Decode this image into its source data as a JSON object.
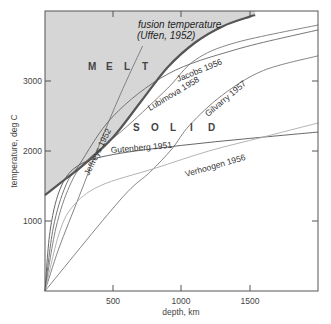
{
  "chart_data": {
    "type": "line",
    "title": "",
    "xlabel": "depth, km",
    "ylabel": "temperature, deg C",
    "xlim": [
      0,
      2000
    ],
    "ylim": [
      0,
      4000
    ],
    "x_ticks": [
      500,
      1000,
      1500
    ],
    "y_ticks": [
      1000,
      2000,
      3000
    ],
    "x_tick_labels": [
      "500",
      "1000",
      "1500"
    ],
    "y_tick_labels": [
      "1000",
      "2000",
      "3000"
    ],
    "grid": false,
    "legend": "inline curve labels",
    "regions": [
      {
        "label": "M E L T",
        "fill": "#d6d6d6",
        "description": "area above fusion temperature curve"
      },
      {
        "label": "S O L I D",
        "fill": "#ffffff",
        "description": "area below fusion temperature curve"
      }
    ],
    "series": [
      {
        "name": "fusion temperature (Uffen, 1952)",
        "style": "thick",
        "color": "#555555",
        "x": [
          0,
          150,
          300,
          500,
          700,
          900,
          1100,
          1300,
          1500,
          1540
        ],
        "y": [
          1370,
          1600,
          1830,
          2200,
          2700,
          3200,
          3550,
          3780,
          3920,
          3940
        ]
      },
      {
        "name": "Jeffreys 1952",
        "color": "#777777",
        "x": [
          0,
          100,
          250,
          400,
          550,
          715
        ],
        "y": [
          0,
          600,
          1350,
          2100,
          2800,
          3500
        ]
      },
      {
        "name": "Jacobs 1956",
        "color": "#666666",
        "x": [
          0,
          60,
          150,
          250,
          500,
          900,
          1400,
          2000
        ],
        "y": [
          0,
          900,
          1500,
          1800,
          2500,
          3100,
          3450,
          3730
        ]
      },
      {
        "name": "Lubimova 1958",
        "color": "#777777",
        "x": [
          0,
          80,
          180,
          300,
          600,
          900,
          1100,
          1400,
          2000
        ],
        "y": [
          0,
          900,
          1500,
          1850,
          2350,
          2900,
          3300,
          3550,
          3800
        ]
      },
      {
        "name": "Gilvarry 1957",
        "color": "#777777",
        "x": [
          0,
          550,
          770,
          930,
          1060,
          1300,
          1600,
          2000
        ],
        "y": [
          0,
          1300,
          1700,
          2030,
          2370,
          2800,
          3150,
          3360
        ]
      },
      {
        "name": "Gutenberg 1951",
        "color": "#555555",
        "x": [
          0,
          40,
          120,
          250,
          500,
          1000,
          1500,
          2000
        ],
        "y": [
          0,
          900,
          1500,
          1800,
          1950,
          2080,
          2180,
          2270
        ]
      },
      {
        "name": "Verhoogen 1956",
        "color": "#aaaaaa",
        "x": [
          0,
          100,
          200,
          400,
          800,
          1200,
          1600,
          2000
        ],
        "y": [
          0,
          800,
          1200,
          1500,
          1750,
          2000,
          2200,
          2400
        ]
      }
    ],
    "annotations": [
      {
        "text": "fusion temperature",
        "style": "italic"
      },
      {
        "text": "(Uffen, 1952)",
        "style": "italic"
      },
      {
        "text": "M E L T"
      },
      {
        "text": "S O L I D"
      },
      {
        "text": "Jeffreys 1952"
      },
      {
        "text": "Jacobs 1956"
      },
      {
        "text": "Lubimova 1958"
      },
      {
        "text": "Gilvarry 1957"
      },
      {
        "text": "Gutenberg 1951"
      },
      {
        "text": "Verhoogen 1956"
      }
    ]
  },
  "labels": {
    "xlabel": "depth, km",
    "ylabel": "temperature, deg C",
    "fusion_line1": "fusion temperature",
    "fusion_line2": "(Uffen, 1952)",
    "melt": [
      "M",
      "E",
      "L",
      "T"
    ],
    "solid": [
      "S",
      "O",
      "L",
      "I",
      "D"
    ],
    "jeffreys": "Jeffreys 1952",
    "jacobs": "Jacobs 1956",
    "lubimova": "Lubimova 1958",
    "gilvarry": "Gilvarry 1957",
    "gutenberg": "Gutenberg 1951",
    "verhoogen": "Verhoogen 1956",
    "x_ticks": [
      "500",
      "1000",
      "1500"
    ],
    "y_ticks": [
      "1000",
      "2000",
      "3000"
    ]
  }
}
